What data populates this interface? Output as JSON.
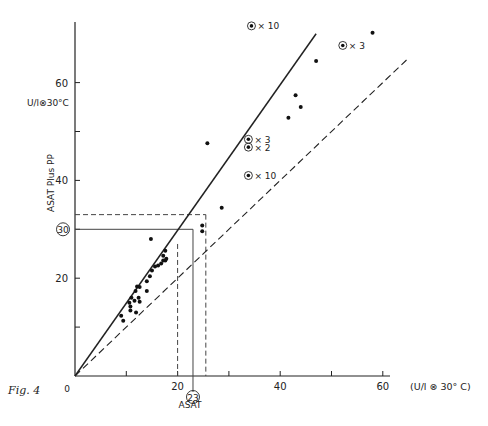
{
  "caption": "Fig. 4",
  "chart_data": {
    "type": "scatter",
    "title": "",
    "xlabel": "ASAT",
    "x_unit": "(U/l ⊗ 30° C)",
    "ylabel": "ASAT Plus PP",
    "y_unit": "U/l⊗30°C",
    "xlim": [
      0,
      68
    ],
    "ylim": [
      0,
      76
    ],
    "x_ticks": [
      10,
      20,
      30,
      40,
      50,
      60
    ],
    "x_tick_labels": [
      "",
      "20",
      "",
      "40",
      "",
      "60"
    ],
    "y_ticks": [
      10,
      20,
      30,
      40,
      50,
      60
    ],
    "y_tick_labels": [
      "",
      "20",
      "30",
      "40",
      "",
      "60"
    ],
    "origin_label": "0",
    "grid": false,
    "lines": [
      {
        "name": "regression line",
        "style": "solid",
        "x": [
          0,
          47
        ],
        "y": [
          0,
          70
        ]
      },
      {
        "name": "identity line (y = x)",
        "style": "dashed",
        "x": [
          0,
          65
        ],
        "y": [
          0,
          65
        ]
      }
    ],
    "reference_lines": [
      {
        "style": "solid",
        "horizontal_y": 30,
        "vertical_x": 23,
        "note": "circled values 30 and 23"
      },
      {
        "style": "dashed",
        "horizontal_y": 33,
        "vertical_x": 25.5
      },
      {
        "style": "dashed",
        "vertical_x": 20,
        "from_y": 0,
        "to_y": 27
      }
    ],
    "circled_labels": {
      "y": "30",
      "x": "23"
    },
    "points": [
      {
        "x": 9.0,
        "y": 12.3
      },
      {
        "x": 9.4,
        "y": 11.3
      },
      {
        "x": 10.6,
        "y": 15.0
      },
      {
        "x": 10.8,
        "y": 14.2
      },
      {
        "x": 10.8,
        "y": 13.4
      },
      {
        "x": 11.0,
        "y": 16.0
      },
      {
        "x": 11.6,
        "y": 15.4
      },
      {
        "x": 11.8,
        "y": 17.4
      },
      {
        "x": 11.9,
        "y": 13.0
      },
      {
        "x": 12.1,
        "y": 18.3
      },
      {
        "x": 12.4,
        "y": 16.0
      },
      {
        "x": 12.6,
        "y": 15.2
      },
      {
        "x": 12.6,
        "y": 18.2
      },
      {
        "x": 14.0,
        "y": 19.4
      },
      {
        "x": 14.0,
        "y": 17.4
      },
      {
        "x": 14.6,
        "y": 20.4
      },
      {
        "x": 15.0,
        "y": 21.6
      },
      {
        "x": 15.6,
        "y": 22.4
      },
      {
        "x": 16.2,
        "y": 22.6
      },
      {
        "x": 16.8,
        "y": 23.0
      },
      {
        "x": 17.2,
        "y": 24.6
      },
      {
        "x": 17.6,
        "y": 25.6
      },
      {
        "x": 17.6,
        "y": 23.6
      },
      {
        "x": 17.8,
        "y": 24.0
      },
      {
        "x": 17.2,
        "y": 23.6
      },
      {
        "x": 14.8,
        "y": 28.0
      },
      {
        "x": 24.8,
        "y": 30.8
      },
      {
        "x": 24.8,
        "y": 29.6
      },
      {
        "x": 25.8,
        "y": 47.6
      },
      {
        "x": 28.6,
        "y": 34.4
      },
      {
        "x": 41.6,
        "y": 52.8
      },
      {
        "x": 43.0,
        "y": 57.4
      },
      {
        "x": 44.0,
        "y": 55.0
      },
      {
        "x": 47.0,
        "y": 64.4
      },
      {
        "x": 58.0,
        "y": 70.2
      }
    ],
    "multiple_points": [
      {
        "x": 34.4,
        "y": 71.6,
        "count": "× 10"
      },
      {
        "x": 52.2,
        "y": 67.6,
        "count": "× 3"
      },
      {
        "x": 33.8,
        "y": 48.4,
        "count": "× 3"
      },
      {
        "x": 33.8,
        "y": 46.8,
        "count": "× 2"
      },
      {
        "x": 33.8,
        "y": 41.0,
        "count": "× 10"
      }
    ]
  }
}
